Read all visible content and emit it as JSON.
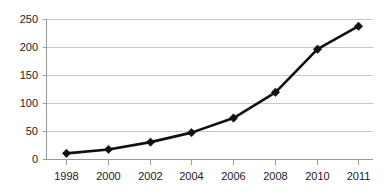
{
  "chart_data": {
    "type": "line",
    "title": "",
    "subtitle": "",
    "xlabel": "",
    "ylabel": "",
    "categories": [
      "1998",
      "2000",
      "2002",
      "2004",
      "2006",
      "2008",
      "2010",
      "2011"
    ],
    "values": [
      11,
      18,
      31,
      48,
      74,
      120,
      197,
      238
    ],
    "series": [
      {
        "name": "",
        "values": [
          11,
          18,
          31,
          48,
          74,
          120,
          197,
          238
        ]
      }
    ],
    "ylim": [
      0,
      250
    ],
    "ytick_labels": [
      "0",
      "50",
      "100",
      "150",
      "200",
      "250"
    ],
    "ytick_values": [
      0,
      50,
      100,
      150,
      200,
      250
    ],
    "xtick_labels": [
      "1998",
      "2000",
      "2002",
      "2004",
      "2006",
      "2008",
      "2010",
      "2011"
    ],
    "grid": true,
    "grid_axis": "y",
    "legend": false,
    "legend_position": "none",
    "marker": "diamond",
    "colors": {
      "series": "#111111",
      "gridline": "#c8c8c8",
      "axis": "#9a9a9a",
      "text": "#1a1a1a",
      "background": "#ffffff"
    }
  }
}
